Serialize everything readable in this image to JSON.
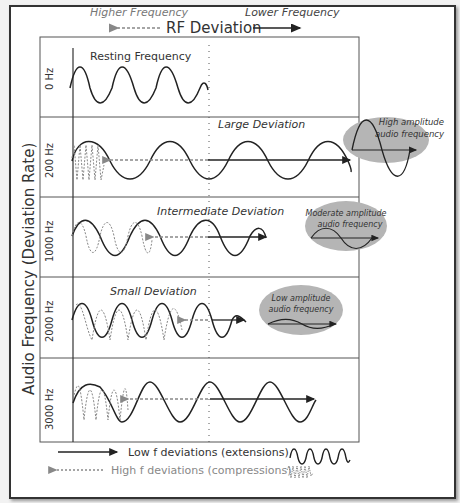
{
  "header": {
    "title": "RF Deviation",
    "left_label": "Higher Frequency",
    "right_label": "Lower Frequency"
  },
  "y_axis_label": "Audio Frequency (Deviation Rate)",
  "rows": [
    {
      "freq": "0 Hz",
      "title": "Resting Frequency"
    },
    {
      "freq": "200 Hz",
      "title": "Large Deviation",
      "bubble": [
        "High amplitude",
        "audio frequency"
      ]
    },
    {
      "freq": "1000 Hz",
      "title": "Intermediate Deviation",
      "bubble": [
        "Moderate amplitude",
        "audio frequency"
      ]
    },
    {
      "freq": "2000 Hz",
      "title": "Small Deviation",
      "bubble": [
        "Low amplitude",
        "audio frequency"
      ]
    },
    {
      "freq": "3000 Hz",
      "title": ""
    }
  ],
  "legend": {
    "low": "Low f deviations (extensions)",
    "high": "High f deviations (compressions)"
  },
  "colors": {
    "dark": "#222222",
    "gray": "#8a8a8a",
    "bubble": "#b5b5b5"
  }
}
